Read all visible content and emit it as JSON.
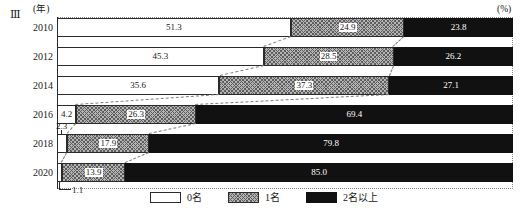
{
  "figure": {
    "marker": "Ⅲ",
    "axis_unit_label": "(年)",
    "value_unit_label": "(%)"
  },
  "chart_data": {
    "type": "bar",
    "orientation": "horizontal",
    "stacked": true,
    "normalized_percent": true,
    "title": "",
    "xlabel": "(%)",
    "ylabel": "(年)",
    "xlim": [
      0,
      100
    ],
    "grid": false,
    "legend_position": "bottom",
    "categories": [
      "2010",
      "2012",
      "2014",
      "2016",
      "2018",
      "2020"
    ],
    "series": [
      {
        "name": "0名",
        "values": [
          51.3,
          45.3,
          35.6,
          4.2,
          2.3,
          1.1
        ]
      },
      {
        "name": "1名",
        "values": [
          24.9,
          28.5,
          37.3,
          26.3,
          17.9,
          13.9
        ]
      },
      {
        "name": "2名以上",
        "values": [
          23.8,
          26.2,
          27.1,
          69.4,
          79.8,
          85.0
        ]
      }
    ],
    "annotations": [
      {
        "text": "2.3",
        "points_to": "2018 series 0名"
      },
      {
        "text": "1.1",
        "points_to": "2020 series 0名"
      }
    ]
  },
  "rows": [
    {
      "year": "2010",
      "a": "51.3",
      "b": "24.9",
      "c": "23.8",
      "a_val": 51.3,
      "b_val": 24.9,
      "c_val": 23.8,
      "a_inline": true
    },
    {
      "year": "2012",
      "a": "45.3",
      "b": "28.5",
      "c": "26.2",
      "a_val": 45.3,
      "b_val": 28.5,
      "c_val": 26.2,
      "a_inline": true
    },
    {
      "year": "2014",
      "a": "35.6",
      "b": "37.3",
      "c": "27.1",
      "a_val": 35.6,
      "b_val": 37.3,
      "c_val": 27.1,
      "a_inline": true
    },
    {
      "year": "2016",
      "a": "4.2",
      "b": "26.3",
      "c": "69.4",
      "a_val": 4.2,
      "b_val": 26.3,
      "c_val": 69.4,
      "a_inline": true
    },
    {
      "year": "2018",
      "a": "2.3",
      "b": "17.9",
      "c": "79.8",
      "a_val": 2.3,
      "b_val": 17.9,
      "c_val": 79.8,
      "a_inline": false
    },
    {
      "year": "2020",
      "a": "1.1",
      "b": "13.9",
      "c": "85.0",
      "a_val": 1.1,
      "b_val": 13.9,
      "c_val": 85.0,
      "a_inline": false
    }
  ],
  "callouts": {
    "c2018": "2.3",
    "c2020": "1.1"
  },
  "legend": {
    "items": [
      {
        "label": "0名",
        "pattern": "dotted"
      },
      {
        "label": "1名",
        "pattern": "crosshatch"
      },
      {
        "label": "2名以上",
        "pattern": "solid-black"
      }
    ]
  },
  "colors": {
    "series_a_fill": "#ffffff",
    "series_a_dot": "#4a4a4a",
    "series_b_fill": "#b4b4b4",
    "series_b_hatch": "#5e5e5e",
    "series_c_fill": "#111111",
    "outline": "#2b2b2b",
    "connector": "#7d7d7d"
  }
}
